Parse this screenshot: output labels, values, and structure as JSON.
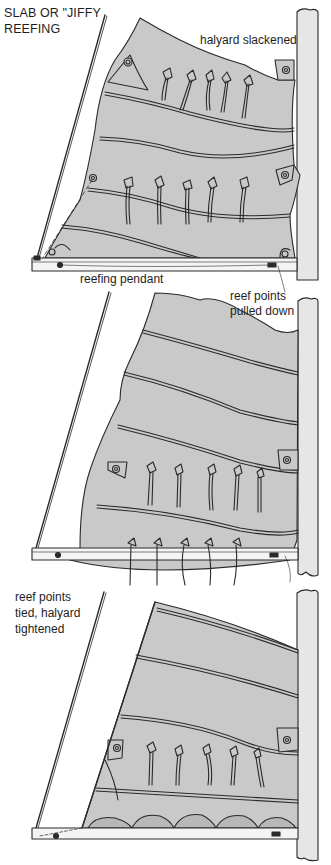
{
  "title": {
    "line1": "SLAB OR \"JIFFY",
    "line2": "REEFING"
  },
  "panels": [
    {
      "id": "stage-1",
      "labels": {
        "halyard": "halyard slackened",
        "pendant": "reefing pendant"
      }
    },
    {
      "id": "stage-2",
      "labels": {
        "line1": "reef points",
        "line2": "pulled down"
      }
    },
    {
      "id": "stage-3",
      "labels": {
        "line1": "reef points",
        "line2": "tied, halyard",
        "line3": "tightened"
      }
    }
  ],
  "colors": {
    "sail": "#c9c9c9",
    "mast": "#e6e6e6",
    "boom": "#f4f4f4",
    "ink": "#2a2a2a"
  }
}
